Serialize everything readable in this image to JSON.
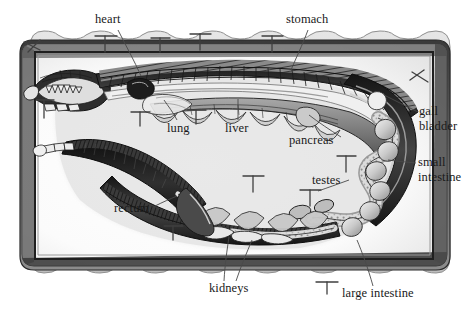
{
  "figure": {
    "view": "ventral dissection, whole body coiled in tray",
    "style": "grayscale engraving / halftone illustration",
    "colors": {
      "background": "#ffffff",
      "tray_rim": "#d2d2d2",
      "tray_rim_shadow": "#a8a8a8",
      "tray_inner": "#f6f6f6",
      "tray_wall_dark": "#2b2b2b",
      "specimen_dark": "#1e1e1e",
      "specimen_mid": "#6e6e6e",
      "specimen_light": "#cfcfcf",
      "label_text": "#1a1a1a",
      "leader_line": "#4a4a4a"
    },
    "tray": {
      "name": "dissection tray",
      "edge": "scalloped wavy rim",
      "corner_radius_px": 26
    }
  },
  "labels": [
    {
      "id": "heart",
      "text": "heart",
      "x": 95,
      "y": 14,
      "align": "left",
      "lines": 1
    },
    {
      "id": "stomach",
      "text": "stomach",
      "x": 286,
      "y": 14,
      "align": "left",
      "lines": 1
    },
    {
      "id": "gall-bladder",
      "text": "gall\nbladder",
      "x": 419,
      "y": 105,
      "align": "left",
      "lines": 2
    },
    {
      "id": "small-intestine",
      "text": "small\nintestine",
      "x": 418,
      "y": 156,
      "align": "left",
      "lines": 2
    },
    {
      "id": "lung",
      "text": "lung",
      "x": 167,
      "y": 123,
      "align": "left",
      "lines": 1
    },
    {
      "id": "liver",
      "text": "liver",
      "x": 225,
      "y": 123,
      "align": "left",
      "lines": 1
    },
    {
      "id": "pancreas",
      "text": "pancreas",
      "x": 289,
      "y": 135,
      "align": "left",
      "lines": 1
    },
    {
      "id": "testes",
      "text": "testes",
      "x": 312,
      "y": 175,
      "align": "left",
      "lines": 1
    },
    {
      "id": "rectum",
      "text": "rectum",
      "x": 114,
      "y": 203,
      "align": "left",
      "lines": 1
    },
    {
      "id": "kidneys",
      "text": "kidneys",
      "x": 209,
      "y": 283,
      "align": "left",
      "lines": 1
    },
    {
      "id": "large-intestine",
      "text": "large intestine",
      "x": 342,
      "y": 288,
      "align": "left",
      "lines": 1
    }
  ],
  "leaders": [
    {
      "id": "heart",
      "path": "M118,30 L140,75"
    },
    {
      "id": "stomach",
      "path": "M307,30 L292,70"
    },
    {
      "id": "gall-bladder",
      "path": "M417,112 L384,96"
    },
    {
      "id": "small-intestine",
      "path": "M416,163 L388,160"
    },
    {
      "id": "lung",
      "path": "M176,120 L165,101"
    },
    {
      "id": "liver",
      "path": "M238,120 L238,100"
    },
    {
      "id": "pancreas",
      "path": "M340,137 L310,116"
    },
    {
      "id": "testes",
      "path": "M348,180 L318,190"
    },
    {
      "id": "rectum",
      "path": "M154,206 L176,196"
    },
    {
      "id": "kidneys-a",
      "path": "M224,281 L229,236"
    },
    {
      "id": "kidneys-b",
      "path": "M236,281 L252,240"
    },
    {
      "id": "large-intestine",
      "path": "M372,286 L358,240"
    }
  ],
  "pins": [
    {
      "id": "pin-top-1",
      "x": 35,
      "y": 48,
      "len": 13,
      "angle": -62
    },
    {
      "id": "pin-top-2",
      "x": 105,
      "y": 35,
      "len": 16,
      "angle": 0
    },
    {
      "id": "pin-top-3",
      "x": 160,
      "y": 38,
      "len": 14,
      "angle": 0
    },
    {
      "id": "pin-top-4",
      "x": 200,
      "y": 33,
      "len": 15,
      "angle": 0
    },
    {
      "id": "pin-top-5",
      "x": 272,
      "y": 36,
      "len": 14,
      "angle": 0
    },
    {
      "id": "pin-top-6",
      "x": 333,
      "y": 232,
      "len": 0,
      "angle": 0
    },
    {
      "id": "pin-left-1",
      "x": 44,
      "y": 105,
      "len": 16,
      "angle": 90
    },
    {
      "id": "pin-mid-1",
      "x": 140,
      "y": 116,
      "len": 14,
      "angle": 0
    },
    {
      "id": "pin-mid-2",
      "x": 195,
      "y": 114,
      "len": 13,
      "angle": 0
    },
    {
      "id": "pin-mid-3",
      "x": 253,
      "y": 182,
      "len": 15,
      "angle": 0
    },
    {
      "id": "pin-mid-4",
      "x": 310,
      "y": 196,
      "len": 14,
      "angle": 0
    },
    {
      "id": "pin-mid-5",
      "x": 345,
      "y": 162,
      "len": 14,
      "angle": 0
    },
    {
      "id": "pin-low-1",
      "x": 173,
      "y": 230,
      "len": 14,
      "angle": 0
    },
    {
      "id": "pin-low-2",
      "x": 327,
      "y": 285,
      "len": 16,
      "angle": 0
    }
  ],
  "organs": [
    "heart",
    "stomach",
    "gall bladder",
    "small intestine",
    "lung",
    "liver",
    "pancreas",
    "testes",
    "rectum",
    "kidneys",
    "large intestine"
  ]
}
